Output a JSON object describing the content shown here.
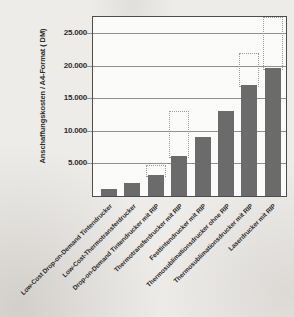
{
  "figure": {
    "page_background": "#eeece9",
    "plot_background": "#fbfbfa",
    "border_color": "#4d4d4d",
    "grid_color": "#909090",
    "text_color": "#2d2d2d"
  },
  "chart_data": {
    "type": "bar",
    "title": "",
    "ylabel": "Anschaffungskosten / A4-Format ( DM)",
    "xlabel": "",
    "categories": [
      "Low-Cost Drop-on-Demand Tintendrucker",
      "Low-Cost-Thermotransferdrucker",
      "Drop-on-Demand Tintendrucker mit RIP",
      "Thermotransferdrucker mit RIP",
      "Festtintendrucker mit RIP",
      "Thermosublimationsdrucker ohne RIP",
      "Thermosublimationsdrucker mit RIP",
      "Laserdrucker mit RIP"
    ],
    "values": [
      1000,
      2000,
      3300,
      6100,
      9000,
      13100,
      17000,
      19600
    ],
    "dashed_max_values": [
      null,
      null,
      4800,
      13100,
      null,
      null,
      22000,
      27500
    ],
    "ytick_values": [
      5000,
      10000,
      15000,
      20000,
      25000
    ],
    "ytick_labels": [
      "5.000",
      "10.000",
      "15.000",
      "20.000",
      "25.000"
    ],
    "ylim": [
      0,
      27500
    ],
    "grid": true,
    "legend": "none",
    "bar_color": "#6b6b6b",
    "dashed_outline_color": "#9b9b9b"
  }
}
